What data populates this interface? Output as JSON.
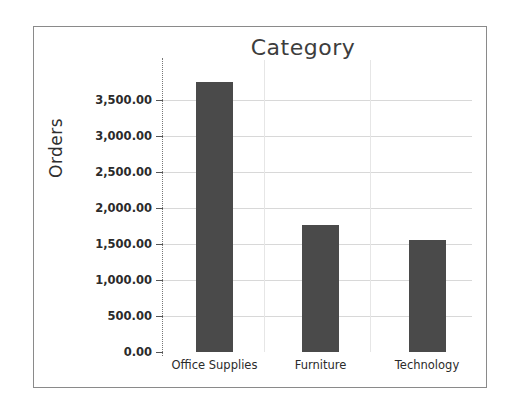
{
  "chart_data": {
    "type": "bar",
    "title": "Category",
    "xlabel": "",
    "ylabel": "Orders",
    "categories": [
      "Office Supplies",
      "Furniture",
      "Technology"
    ],
    "values": [
      3750,
      1760,
      1550
    ],
    "ylim": [
      0,
      3750
    ],
    "ytick_values": [
      0,
      500,
      1000,
      1500,
      2000,
      2500,
      3000,
      3500
    ],
    "ytick_labels": [
      "0.00",
      "500.00",
      "1,000.00",
      "1,500.00",
      "2,000.00",
      "2,500.00",
      "3,000.00",
      "3,500.00"
    ],
    "grid": true,
    "legend": false,
    "bar_color": "#4a4a4a",
    "gridline_color": "#d8d8d8",
    "axis_color": "#777777",
    "border_color": "#8a8a8a",
    "background_color": "#ffffff"
  }
}
